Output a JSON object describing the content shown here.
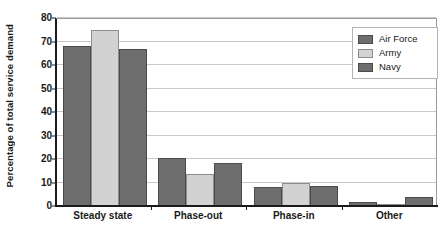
{
  "chart_data": {
    "type": "bar",
    "title": "",
    "xlabel": "",
    "ylabel": "Percentage of total service demand",
    "categories": [
      "Steady state",
      "Phase-out",
      "Phase-in",
      "Other"
    ],
    "series": [
      {
        "name": "Air Force",
        "color": "#6e6e6e",
        "values": [
          68,
          20.5,
          8,
          1.5
        ]
      },
      {
        "name": "Army",
        "color": "#d2d2d2",
        "values": [
          75,
          13.5,
          10,
          0.5
        ]
      },
      {
        "name": "Navy",
        "color": "#6e6e6e",
        "values": [
          67,
          18.5,
          8.5,
          4
        ]
      }
    ],
    "ylim": [
      0,
      80
    ],
    "yticks": [
      0,
      10,
      20,
      30,
      40,
      50,
      60,
      70,
      80
    ],
    "ytick_labels": [
      "0",
      "10",
      "20",
      "30",
      "40",
      "50",
      "60",
      "70",
      "80"
    ],
    "grid": true,
    "legend_position": "top-right",
    "legend_entries": [
      "Air Force",
      "Army",
      "Navy"
    ]
  }
}
